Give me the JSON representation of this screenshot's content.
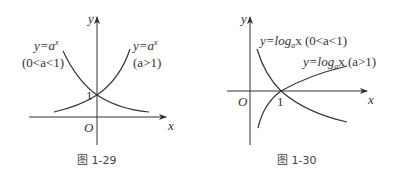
{
  "figures": [
    {
      "caption": "图 1-29",
      "axis_labels": {
        "x": "x",
        "y": "y",
        "origin": "O"
      },
      "tick_label": "1",
      "curves": [
        {
          "label_eq": "y=a",
          "label_sup": "x",
          "label_cond": "(0<a<1)",
          "type": "decreasing exponential"
        },
        {
          "label_eq": "y=a",
          "label_sup": "x",
          "label_cond": "(a>1)",
          "type": "increasing exponential"
        }
      ]
    },
    {
      "caption": "图 1-30",
      "axis_labels": {
        "x": "x",
        "y": "y",
        "origin": "O"
      },
      "tick_label": "1",
      "curves": [
        {
          "label_pre": "y=log",
          "label_sub": "a",
          "label_post": "x (0<a<1)",
          "type": "decreasing logarithm"
        },
        {
          "label_pre": "y=log",
          "label_sub": "a",
          "label_post": "x (a>1)",
          "type": "increasing logarithm"
        }
      ]
    }
  ],
  "colors": {
    "stroke": "#333333",
    "background": "#ffffff"
  }
}
